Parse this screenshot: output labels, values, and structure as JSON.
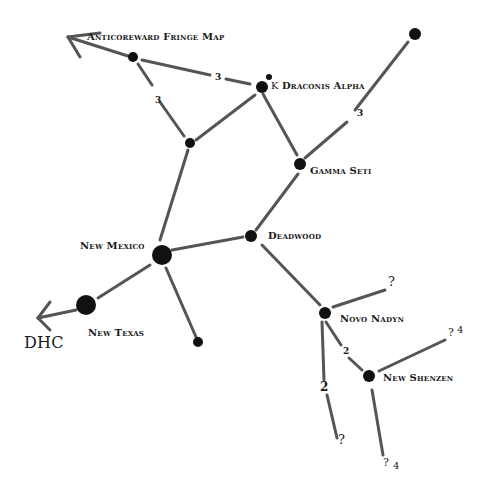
{
  "title": "Anticoreward Fringe Map",
  "accent_colors": {
    "line": "#555555",
    "node": "#111111",
    "text": "#1a1a1a"
  },
  "systems": [
    {
      "name": "Anticoreward Fringe Map"
    },
    {
      "name": "Draconis Alpha",
      "prefix": "K"
    },
    {
      "name": "Gamma Seti"
    },
    {
      "name": "Deadwood"
    },
    {
      "name": "New Mexico"
    },
    {
      "name": "New Texas"
    },
    {
      "name": "Novo Nadyn"
    },
    {
      "name": "New Shenzen"
    },
    {
      "name": "DHC"
    }
  ],
  "edge_labels": [
    "3",
    "3",
    "3",
    "2",
    "2"
  ],
  "unknowns": [
    "?",
    "? 4",
    "?",
    "? 4"
  ],
  "labels": {
    "title": "Anticoreward Fringe Map",
    "draconis": "Draconis Alpha",
    "draconis_prefix": "K",
    "gamma": "Gamma Seti",
    "deadwood": "Deadwood",
    "newmexico": "New Mexico",
    "newtexas": "New Texas",
    "novonadyn": "Novo Nadyn",
    "newshenzen": "New Shenzen",
    "dhc": "DHC",
    "e1": "3",
    "e2": "3",
    "e3": "3",
    "e4": "2",
    "e5": "2",
    "q1": "?",
    "q2": "?",
    "q2n": "4",
    "q3": "?",
    "q4": "?",
    "q4n": "4"
  }
}
